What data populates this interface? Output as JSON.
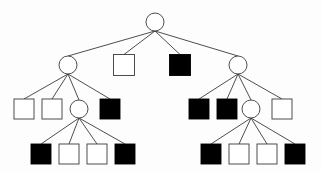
{
  "figure": {
    "title": "",
    "background_color": "#fdfdfd",
    "stroke_color": "#3a3a3a",
    "fill_white": "#ffffff",
    "fill_black": "#000000",
    "width": 321,
    "height": 173
  },
  "chart_data": {
    "type": "diagram",
    "diagram_kind": "game-tree",
    "title": "",
    "xlabel": "",
    "ylabel": "",
    "legend": [
      {
        "label": "internal node",
        "shape": "circle",
        "fill": "#ffffff"
      },
      {
        "label": "leaf (white)",
        "shape": "square",
        "fill": "#ffffff"
      },
      {
        "label": "leaf (black)",
        "shape": "square",
        "fill": "#000000"
      }
    ],
    "levels": [
      {
        "index": 0,
        "y": 22,
        "node_ids": [
          "n0"
        ]
      },
      {
        "index": 1,
        "y": 65,
        "node_ids": [
          "n1",
          "n2",
          "n3",
          "n4"
        ]
      },
      {
        "index": 2,
        "y": 109,
        "node_ids": [
          "n5",
          "n6",
          "n7",
          "n8",
          "n9",
          "n10",
          "n11",
          "n12"
        ]
      },
      {
        "index": 3,
        "y": 154,
        "node_ids": [
          "n13",
          "n14",
          "n15",
          "n16",
          "n17",
          "n18",
          "n19",
          "n20"
        ]
      }
    ],
    "nodes": [
      {
        "id": "n0",
        "shape": "circle",
        "fill": "#ffffff",
        "cx": 155,
        "cy": 22,
        "r": 9,
        "level": 0
      },
      {
        "id": "n1",
        "shape": "circle",
        "fill": "#ffffff",
        "cx": 68,
        "cy": 65,
        "r": 9,
        "level": 1
      },
      {
        "id": "n2",
        "shape": "square",
        "fill": "#ffffff",
        "cx": 124,
        "cy": 65,
        "size": 21,
        "level": 1
      },
      {
        "id": "n3",
        "shape": "square",
        "fill": "#000000",
        "cx": 180,
        "cy": 65,
        "size": 21,
        "level": 1
      },
      {
        "id": "n4",
        "shape": "circle",
        "fill": "#ffffff",
        "cx": 238,
        "cy": 65,
        "r": 9,
        "level": 1
      },
      {
        "id": "n5",
        "shape": "square",
        "fill": "#ffffff",
        "cx": 24,
        "cy": 109,
        "size": 20,
        "level": 2
      },
      {
        "id": "n6",
        "shape": "square",
        "fill": "#ffffff",
        "cx": 52,
        "cy": 109,
        "size": 20,
        "level": 2
      },
      {
        "id": "n7",
        "shape": "circle",
        "fill": "#ffffff",
        "cx": 79,
        "cy": 109,
        "r": 9,
        "level": 2
      },
      {
        "id": "n8",
        "shape": "square",
        "fill": "#000000",
        "cx": 110,
        "cy": 109,
        "size": 20,
        "level": 2
      },
      {
        "id": "n9",
        "shape": "square",
        "fill": "#000000",
        "cx": 199,
        "cy": 109,
        "size": 20,
        "level": 2
      },
      {
        "id": "n10",
        "shape": "square",
        "fill": "#000000",
        "cx": 227,
        "cy": 109,
        "size": 20,
        "level": 2
      },
      {
        "id": "n11",
        "shape": "circle",
        "fill": "#ffffff",
        "cx": 251,
        "cy": 109,
        "r": 9,
        "level": 2
      },
      {
        "id": "n12",
        "shape": "square",
        "fill": "#ffffff",
        "cx": 282,
        "cy": 109,
        "size": 20,
        "level": 2
      },
      {
        "id": "n13",
        "shape": "square",
        "fill": "#000000",
        "cx": 41,
        "cy": 154,
        "size": 20,
        "level": 3
      },
      {
        "id": "n14",
        "shape": "square",
        "fill": "#ffffff",
        "cx": 69,
        "cy": 154,
        "size": 20,
        "level": 3
      },
      {
        "id": "n15",
        "shape": "square",
        "fill": "#ffffff",
        "cx": 97,
        "cy": 154,
        "size": 20,
        "level": 3
      },
      {
        "id": "n16",
        "shape": "square",
        "fill": "#000000",
        "cx": 125,
        "cy": 154,
        "size": 20,
        "level": 3
      },
      {
        "id": "n17",
        "shape": "square",
        "fill": "#000000",
        "cx": 211,
        "cy": 154,
        "size": 20,
        "level": 3
      },
      {
        "id": "n18",
        "shape": "square",
        "fill": "#ffffff",
        "cx": 239,
        "cy": 154,
        "size": 20,
        "level": 3
      },
      {
        "id": "n19",
        "shape": "square",
        "fill": "#ffffff",
        "cx": 267,
        "cy": 154,
        "size": 20,
        "level": 3
      },
      {
        "id": "n20",
        "shape": "square",
        "fill": "#000000",
        "cx": 295,
        "cy": 154,
        "size": 20,
        "level": 3
      }
    ],
    "edges": [
      {
        "from": "n0",
        "to": "n1"
      },
      {
        "from": "n0",
        "to": "n2"
      },
      {
        "from": "n0",
        "to": "n3"
      },
      {
        "from": "n0",
        "to": "n4"
      },
      {
        "from": "n1",
        "to": "n5"
      },
      {
        "from": "n1",
        "to": "n6"
      },
      {
        "from": "n1",
        "to": "n7"
      },
      {
        "from": "n1",
        "to": "n8"
      },
      {
        "from": "n4",
        "to": "n9"
      },
      {
        "from": "n4",
        "to": "n10"
      },
      {
        "from": "n4",
        "to": "n11"
      },
      {
        "from": "n4",
        "to": "n12"
      },
      {
        "from": "n7",
        "to": "n13"
      },
      {
        "from": "n7",
        "to": "n14"
      },
      {
        "from": "n7",
        "to": "n15"
      },
      {
        "from": "n7",
        "to": "n16"
      },
      {
        "from": "n11",
        "to": "n17"
      },
      {
        "from": "n11",
        "to": "n18"
      },
      {
        "from": "n11",
        "to": "n19"
      },
      {
        "from": "n11",
        "to": "n20"
      }
    ]
  }
}
